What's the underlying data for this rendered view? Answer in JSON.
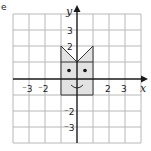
{
  "figure": {
    "label": "e",
    "x_axis_label": "x",
    "y_axis_label": "y",
    "x_tick_labels": [
      {
        "value": -3,
        "text": "⁻3"
      },
      {
        "value": -2,
        "text": "⁻2"
      },
      {
        "value": 2,
        "text": "2"
      },
      {
        "value": 3,
        "text": "3"
      }
    ],
    "y_tick_labels": [
      {
        "value": 3,
        "text": "3"
      },
      {
        "value": 2,
        "text": "2"
      },
      {
        "value": -2,
        "text": "⁻2"
      },
      {
        "value": -3,
        "text": "⁻3"
      }
    ],
    "grid_range": {
      "x": [
        -4,
        4
      ],
      "y": [
        -4,
        4
      ]
    },
    "shape": {
      "description": "cat face",
      "fill_color": "#e2e2e2",
      "outline_vertices": [
        [
          -1,
          -1
        ],
        [
          1,
          -1
        ],
        [
          1,
          2
        ],
        [
          0,
          1
        ],
        [
          -1,
          2
        ]
      ],
      "body_rect": [
        [
          -1,
          -1
        ],
        [
          1,
          1
        ]
      ],
      "eyes": [
        [
          -0.5,
          0.5
        ],
        [
          0.5,
          0.5
        ]
      ],
      "mouth": "smile at y=-0.5"
    }
  }
}
